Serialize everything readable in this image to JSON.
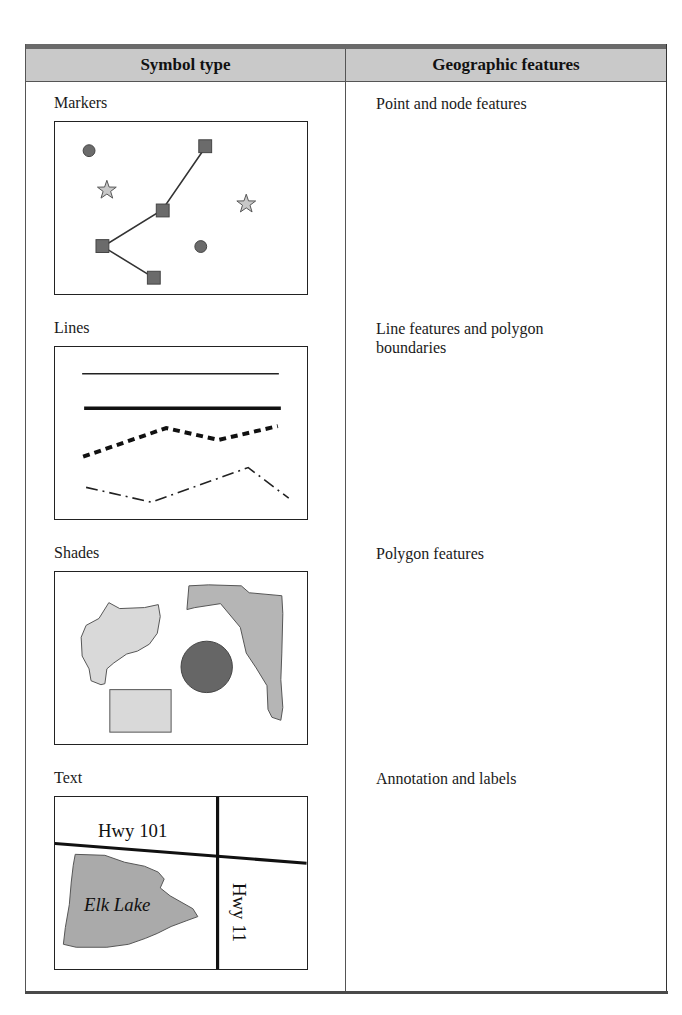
{
  "table": {
    "headers": {
      "symbol_type": "Symbol type",
      "geographic_features": "Geographic features"
    },
    "rows": [
      {
        "symbol_type": "Markers",
        "geographic_features": "Point and node features",
        "illustration": "markers-map",
        "elements": [
          "circles",
          "stars",
          "squares connected by lines"
        ]
      },
      {
        "symbol_type": "Lines",
        "geographic_features": "Line features and polygon boundaries",
        "illustration": "lines-map",
        "elements": [
          "thin solid line",
          "thick solid line",
          "thick dashed line",
          "dash-dot line"
        ]
      },
      {
        "symbol_type": "Shades",
        "geographic_features": "Polygon features",
        "illustration": "shades-map",
        "elements": [
          "light irregular polygon",
          "medium irregular polygon",
          "dark circle",
          "light rectangle"
        ]
      },
      {
        "symbol_type": "Text",
        "geographic_features": "Annotation and labels",
        "illustration": "text-map",
        "map_labels": {
          "hwy101": "Hwy 101",
          "hwy11": "Hwy 11",
          "lake": "Elk Lake"
        }
      }
    ]
  },
  "colors": {
    "header_bg": "#c9c9c9",
    "top_rule": "#6a6a6a",
    "marker_fill": "#6b6b6b",
    "star_fill": "#c8c8c8",
    "light_shade": "#d9d9d9",
    "medium_shade": "#b5b5b5",
    "dark_shade": "#666666",
    "lake_fill": "#aaaaaa"
  }
}
